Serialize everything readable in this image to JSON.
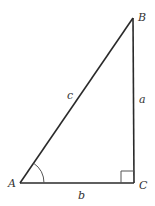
{
  "diagram": {
    "type": "right-triangle",
    "vertices": [
      {
        "id": "A",
        "label": "A",
        "x": 20,
        "y": 183,
        "label_x": 8,
        "label_y": 187
      },
      {
        "id": "B",
        "label": "B",
        "x": 133,
        "y": 18,
        "label_x": 138,
        "label_y": 21
      },
      {
        "id": "C",
        "label": "C",
        "x": 134,
        "y": 183,
        "label_x": 139,
        "label_y": 189
      }
    ],
    "sides": [
      {
        "id": "a",
        "label": "a",
        "from": "B",
        "to": "C",
        "label_x": 139,
        "label_y": 103
      },
      {
        "id": "b",
        "label": "b",
        "from": "A",
        "to": "C",
        "label_x": 78,
        "label_y": 199
      },
      {
        "id": "c",
        "label": "c",
        "from": "A",
        "to": "B",
        "label_x": 67,
        "label_y": 99
      }
    ],
    "angle_mark_at": "A",
    "right_angle_at": "C"
  }
}
